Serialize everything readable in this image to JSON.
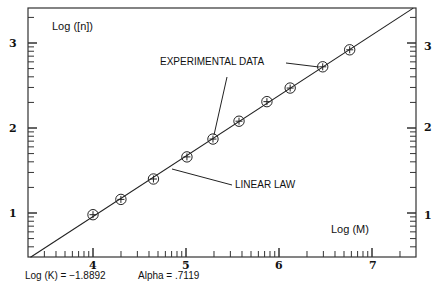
{
  "chart_data": {
    "type": "scatter",
    "title": "",
    "xlabel": "Log (M)",
    "ylabel": "Log ([n])",
    "xlim": [
      3.3,
      7.47
    ],
    "ylim": [
      0.48,
      3.41
    ],
    "x_ticks": [
      4,
      5,
      6,
      7
    ],
    "y_ticks": [
      1,
      2,
      3
    ],
    "grid": false,
    "legend": null,
    "series": [
      {
        "name": "Experimental data",
        "marker": "circle-plus",
        "x": [
          4.0,
          4.3,
          4.65,
          5.01,
          5.29,
          5.57,
          5.87,
          6.12,
          6.47,
          6.76
        ],
        "y": [
          0.98,
          1.16,
          1.4,
          1.66,
          1.87,
          2.08,
          2.31,
          2.47,
          2.72,
          2.92
        ]
      },
      {
        "name": "Linear law",
        "type": "line",
        "intercept": -1.8892,
        "slope": 0.7119
      }
    ],
    "annotations": [
      {
        "text": "EXPERIMENTAL DATA",
        "points_to": [
          [
            5.29,
            1.87
          ],
          [
            6.47,
            2.72
          ]
        ]
      },
      {
        "text": "LINEAR LAW",
        "points_to": [
          [
            5.16,
            1.78
          ]
        ]
      }
    ],
    "footer": {
      "logk": "Log (K) = −1.8892",
      "alpha": "Alpha = .7119"
    }
  },
  "labels": {
    "ylabel": "Log ([n])",
    "xlabel": "Log (M)",
    "annotation_experimental": "EXPERIMENTAL DATA",
    "annotation_linear": "LINEAR LAW",
    "logk": "Log (K) = −1.8892",
    "alpha": "Alpha = .7119",
    "xtick_4": "4",
    "xtick_5": "5",
    "xtick_6": "6",
    "xtick_7": "7",
    "ytick_1": "1",
    "ytick_2": "2",
    "ytick_3": "3"
  }
}
